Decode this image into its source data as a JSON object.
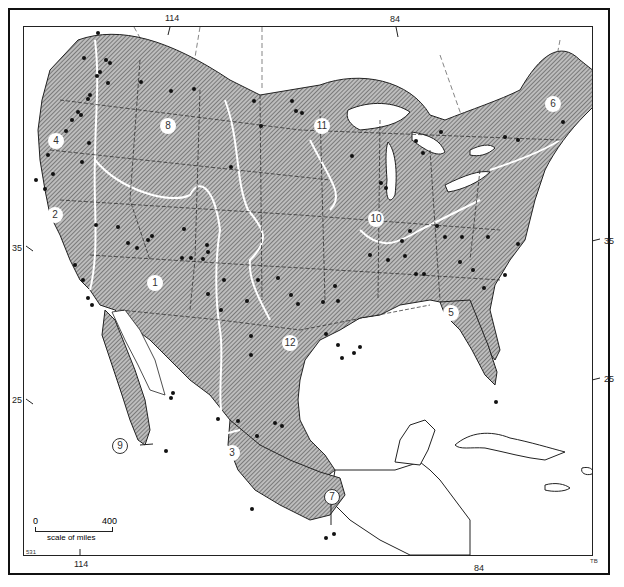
{
  "map": {
    "type": "distribution map",
    "subject_area": "North America (United States, Mexico, southern Canada, Caribbean)",
    "longitude_labels_top": [
      "114",
      "84"
    ],
    "longitude_labels_bottom": [
      "114",
      "84"
    ],
    "latitude_labels_left": [
      "35",
      "25"
    ],
    "latitude_labels_right": [
      "35",
      "25"
    ],
    "region_numbers": [
      "1",
      "2",
      "3",
      "4",
      "5",
      "6",
      "7",
      "8",
      "9",
      "10",
      "11",
      "12"
    ],
    "scale": {
      "start": "0",
      "end": "400",
      "caption": "scale of miles"
    },
    "corner_codes": {
      "bottom_left": "531",
      "bottom_right": "TB"
    },
    "fill_style": "diagonal hatching",
    "colors": {
      "ink": "#111111",
      "hatch": "#555555",
      "background": "#ffffff"
    }
  }
}
